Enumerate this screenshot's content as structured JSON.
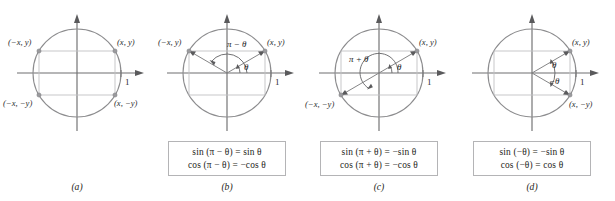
{
  "figure": {
    "axis_tick_label": "1",
    "colors": {
      "circle": "#8c8c8e",
      "rectangle": "#c2c2c4",
      "axis": "#6f6f70",
      "radius": "#7e7e80",
      "text": "#2b2b2d",
      "box_border": "#b4b4b6"
    }
  },
  "panels": [
    {
      "id": "a",
      "caption": "(a)",
      "point_labels": {
        "top_right": "(x, y)",
        "top_left": "(−x, y)",
        "bottom_left": "(−x, −y)",
        "bottom_right": "(x, −y)"
      },
      "axis_label": "1",
      "angle_labels": [],
      "formulas": []
    },
    {
      "id": "b",
      "caption": "(b)",
      "point_labels": {
        "top_right": "(x, y)",
        "top_left": "(−x, y)"
      },
      "axis_label": "1",
      "angle_labels": [
        {
          "name": "pi-minus-theta",
          "text": "π − θ"
        },
        {
          "name": "theta",
          "text": "θ"
        }
      ],
      "formulas": [
        "sin (π − θ) = sin θ",
        "cos (π − θ) = −cos θ"
      ]
    },
    {
      "id": "c",
      "caption": "(c)",
      "point_labels": {
        "top_right": "(x, y)",
        "bottom_left": "(−x, −y)"
      },
      "axis_label": "1",
      "angle_labels": [
        {
          "name": "pi-plus-theta",
          "text": "π + θ"
        },
        {
          "name": "theta",
          "text": "θ"
        }
      ],
      "formulas": [
        "sin (π + θ) = −sin θ",
        "cos (π + θ) = −cos θ"
      ]
    },
    {
      "id": "d",
      "caption": "(d)",
      "point_labels": {
        "top_right": "(x, y)",
        "bottom_right": "(x, −y)"
      },
      "axis_label": "1",
      "angle_labels": [
        {
          "name": "theta",
          "text": "θ"
        },
        {
          "name": "negative-theta",
          "text": "−θ"
        }
      ],
      "formulas": [
        "sin (−θ) = −sin θ",
        "cos (−θ) = cos θ"
      ]
    }
  ]
}
